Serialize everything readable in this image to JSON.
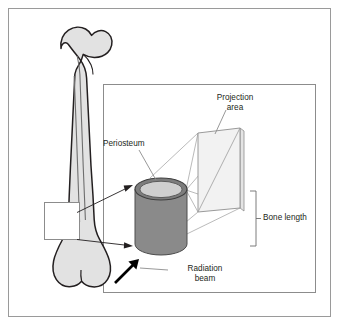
{
  "figure": {
    "labels": {
      "projection_area": "Projection\narea",
      "periosteum": "Periosteum",
      "bone_length": "Bone length",
      "radiation_beam": "Radiation\nbeam"
    },
    "colors": {
      "frame_border": "#9a9a9a",
      "panel_border": "#8c8c8c",
      "background": "#ffffff",
      "bone_fill": "#e2e2e2",
      "bone_outline": "#231f20",
      "bone_inner_line": "#6e6e6e",
      "highlight_fill": "#ffffff",
      "cylinder_body": "#8a8a8a",
      "cylinder_top_ring": "#7d7d7d",
      "cylinder_top_fill": "#cfcfcf",
      "projection_plane_fill": "#f2f2f2",
      "projection_plane_edge": "#8e8e8e",
      "ray_line": "#a8a8a8",
      "leader_line": "#8c8c8c",
      "arrow_thin": "#231f20",
      "arrow_beam": "#000000",
      "text": "#231f20"
    },
    "elements": {
      "femur": "long bone (femur) shown in left margin, proximal head and greater trochanter at top, condyles at bottom",
      "highlight_box": "white rectangle marking the mid-shaft cross-section of the femur",
      "callout_arrows": 2,
      "cylinder": "3D cylinder representing the bone shaft segment with periosteum ring on top face",
      "projection_plane": "tilted rectangular plane with diagonal showing the projected image area",
      "bracket": "vertical bracket with centre tick marking bone length extent",
      "beam_arrow": "thick black arrow indicating direction of the radiation beam"
    }
  }
}
